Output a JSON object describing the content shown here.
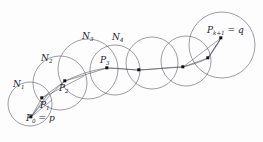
{
  "figure": {
    "kind": "chain-of-neighborhoods-diagram",
    "background_color": "#fdfdfd",
    "stroke_color": "#5a5a66",
    "dot_color": "#111111",
    "neighborhood_labels": [
      {
        "id": "N1",
        "base": "N",
        "sub": "1",
        "x": 13,
        "y": 80
      },
      {
        "id": "N2",
        "base": "N",
        "sub": "2",
        "x": 41,
        "y": 54
      },
      {
        "id": "N3",
        "base": "N",
        "sub": "3",
        "x": 82,
        "y": 32
      },
      {
        "id": "N4",
        "base": "N",
        "sub": "4",
        "x": 112,
        "y": 33
      }
    ],
    "point_labels": [
      {
        "id": "P1",
        "base": "P",
        "sub": "1",
        "x": 40,
        "y": 101
      },
      {
        "id": "P2",
        "base": "P",
        "sub": "2",
        "x": 59,
        "y": 84
      },
      {
        "id": "P3",
        "base": "P",
        "sub": "3",
        "x": 100,
        "y": 56
      }
    ],
    "endpoint_labels": [
      {
        "id": "P0",
        "base": "P",
        "sub": "0",
        "equals": " = p",
        "x": 26,
        "y": 114
      },
      {
        "id": "Pk1",
        "base": "P",
        "sub": "k+1",
        "equals": " = q",
        "x": 207,
        "y": 26
      }
    ],
    "circles": [
      {
        "name": "circle-N1",
        "cx": 30,
        "cy": 104,
        "r": 22
      },
      {
        "name": "circle-N2",
        "cx": 60,
        "cy": 83,
        "r": 27
      },
      {
        "name": "circle-N3",
        "cx": 88,
        "cy": 69,
        "r": 30
      },
      {
        "name": "circle-N4",
        "cx": 115,
        "cy": 70,
        "r": 25
      },
      {
        "name": "circle-N5",
        "cx": 152,
        "cy": 63,
        "r": 26
      },
      {
        "name": "circle-N6",
        "cx": 186,
        "cy": 61,
        "r": 25
      },
      {
        "name": "circle-N7",
        "cx": 222,
        "cy": 45,
        "r": 33
      }
    ],
    "path_points": [
      {
        "name": "point-P0",
        "x": 31,
        "y": 117
      },
      {
        "name": "point-P1",
        "x": 42,
        "y": 98
      },
      {
        "name": "point-P2",
        "x": 65,
        "y": 81
      },
      {
        "name": "point-P3",
        "x": 107,
        "y": 68
      },
      {
        "name": "point-P4",
        "x": 139,
        "y": 70
      },
      {
        "name": "point-P5",
        "x": 183,
        "y": 67
      },
      {
        "name": "point-P6",
        "x": 208,
        "y": 58
      },
      {
        "name": "point-Pk1",
        "x": 221,
        "y": 38
      }
    ],
    "path_polyline": "31,117 42,98 65,81 107,68 139,70 183,67 208,58 221,38",
    "path_curve": "M 31,117 C 40,106 52,92 65,81 C 82,73 94,70 107,68 C 122,68 130,70 139,70 C 158,69 170,67 183,67 C 194,64 201,62 208,58 C 214,50 218,44 221,38",
    "radius_lines": [
      {
        "name": "radius-N1-a",
        "x1": 31,
        "y1": 117,
        "x2": 48,
        "y2": 94
      },
      {
        "name": "radius-N1-b",
        "x1": 31,
        "y1": 117,
        "x2": 52,
        "y2": 100
      },
      {
        "name": "radius-N2-a",
        "x1": 42,
        "y1": 98,
        "x2": 65,
        "y2": 81
      },
      {
        "name": "radius-N2-b",
        "x1": 42,
        "y1": 98,
        "x2": 84,
        "y2": 76
      },
      {
        "name": "radius-Nk-a",
        "x1": 208,
        "y1": 58,
        "x2": 221,
        "y2": 38
      },
      {
        "name": "radius-Nk-b",
        "x1": 183,
        "y1": 67,
        "x2": 221,
        "y2": 38
      }
    ]
  }
}
